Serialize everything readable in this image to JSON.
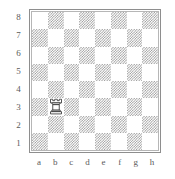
{
  "diagram": {
    "kind": "chess-board-diagram",
    "orientation": "white-bottom",
    "board_size": 8,
    "frame_color": "#8e8e8e",
    "light_square_color": "#ffffff",
    "dark_square_color": "#9a9a9a",
    "label_color": "#5a5a5a",
    "piece_outline_color": "#2b2b2b",
    "piece_fill_color": "#ffffff"
  },
  "labels": {
    "ranks": [
      "8",
      "7",
      "6",
      "5",
      "4",
      "3",
      "2",
      "1"
    ],
    "files": [
      "a",
      "b",
      "c",
      "d",
      "e",
      "f",
      "g",
      "h"
    ]
  },
  "chart_data": {
    "type": "table",
    "title": "",
    "xlabel": "",
    "ylabel": "",
    "categories": [
      "a",
      "b",
      "c",
      "d",
      "e",
      "f",
      "g",
      "h"
    ],
    "rows": [
      "8",
      "7",
      "6",
      "5",
      "4",
      "3",
      "2",
      "1"
    ],
    "squares": [
      [
        "light",
        "dark",
        "light",
        "dark",
        "light",
        "dark",
        "light",
        "dark"
      ],
      [
        "dark",
        "light",
        "dark",
        "light",
        "dark",
        "light",
        "dark",
        "light"
      ],
      [
        "light",
        "dark",
        "light",
        "dark",
        "light",
        "dark",
        "light",
        "dark"
      ],
      [
        "dark",
        "light",
        "dark",
        "light",
        "dark",
        "light",
        "dark",
        "light"
      ],
      [
        "light",
        "dark",
        "light",
        "dark",
        "light",
        "dark",
        "light",
        "dark"
      ],
      [
        "dark",
        "light",
        "dark",
        "light",
        "dark",
        "light",
        "dark",
        "light"
      ],
      [
        "light",
        "dark",
        "light",
        "dark",
        "light",
        "dark",
        "light",
        "dark"
      ],
      [
        "dark",
        "light",
        "dark",
        "light",
        "dark",
        "light",
        "dark",
        "light"
      ]
    ],
    "pieces": [
      {
        "square": "b3",
        "file": "b",
        "rank": "3",
        "file_index": 1,
        "rank_index": 5,
        "color": "white",
        "type": "rook",
        "glyph": "white-rook-icon"
      }
    ]
  }
}
